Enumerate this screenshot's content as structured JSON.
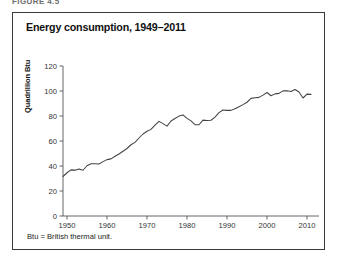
{
  "figure_label": "FIGURE 4.5",
  "chart_title": "Energy consumption, 1949–2011",
  "footnote": "Btu = British thermal unit.",
  "y_axis_title": "Quadrillion Btu",
  "chart_data": {
    "type": "line",
    "title": "Energy consumption, 1949–2011",
    "xlabel": "",
    "ylabel": "Quadrillion Btu",
    "xlim": [
      1949,
      2013
    ],
    "ylim": [
      0,
      120
    ],
    "yticks": [
      0,
      20,
      40,
      60,
      80,
      100,
      120
    ],
    "xticks": [
      1950,
      1960,
      1970,
      1980,
      1990,
      2000,
      2010
    ],
    "grid": false,
    "legend": null,
    "line_color": "#444444",
    "x": [
      1949,
      1950,
      1951,
      1952,
      1953,
      1954,
      1955,
      1956,
      1957,
      1958,
      1959,
      1960,
      1961,
      1962,
      1963,
      1964,
      1965,
      1966,
      1967,
      1968,
      1969,
      1970,
      1971,
      1972,
      1973,
      1974,
      1975,
      1976,
      1977,
      1978,
      1979,
      1980,
      1981,
      1982,
      1983,
      1984,
      1985,
      1986,
      1987,
      1988,
      1989,
      1990,
      1991,
      1992,
      1993,
      1994,
      1995,
      1996,
      1997,
      1998,
      1999,
      2000,
      2001,
      2002,
      2003,
      2004,
      2005,
      2006,
      2007,
      2008,
      2009,
      2010,
      2011
    ],
    "values": [
      31.6,
      34.6,
      36.9,
      36.7,
      37.7,
      36.6,
      40.2,
      41.8,
      41.8,
      41.6,
      43.5,
      45.1,
      45.7,
      47.8,
      49.6,
      51.8,
      54.0,
      57.0,
      58.9,
      62.4,
      65.6,
      67.8,
      69.3,
      72.7,
      75.7,
      73.9,
      71.9,
      76.0,
      78.0,
      79.9,
      80.9,
      78.1,
      76.1,
      73.1,
      73.0,
      76.7,
      76.4,
      76.6,
      79.1,
      82.7,
      84.8,
      84.5,
      84.5,
      85.8,
      87.4,
      89.1,
      91.0,
      94.1,
      94.6,
      94.9,
      96.7,
      98.8,
      96.2,
      97.7,
      98.1,
      100.1,
      100.2,
      99.6,
      101.2,
      99.2,
      94.4,
      97.5,
      97.3
    ]
  }
}
